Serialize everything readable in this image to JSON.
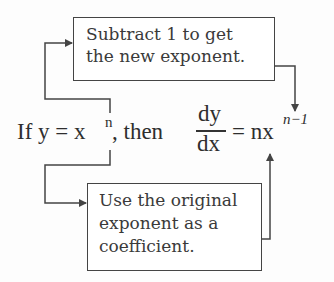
{
  "diagram": {
    "top_box": {
      "lines": [
        "Subtract 1 to get",
        "the new exponent."
      ]
    },
    "bottom_box": {
      "lines": [
        "Use the original",
        "exponent as a",
        "coefficient."
      ]
    },
    "equation": {
      "prefix": "If y = x",
      "prefix_exponent": "n",
      "middle": ", then",
      "fraction_numerator": "dy",
      "fraction_denominator": "dx",
      "rhs": "= nx",
      "rhs_exponent": "n−1"
    },
    "colors": {
      "line": "#444444",
      "text": "#333333",
      "background": "#fdfdfd"
    }
  }
}
